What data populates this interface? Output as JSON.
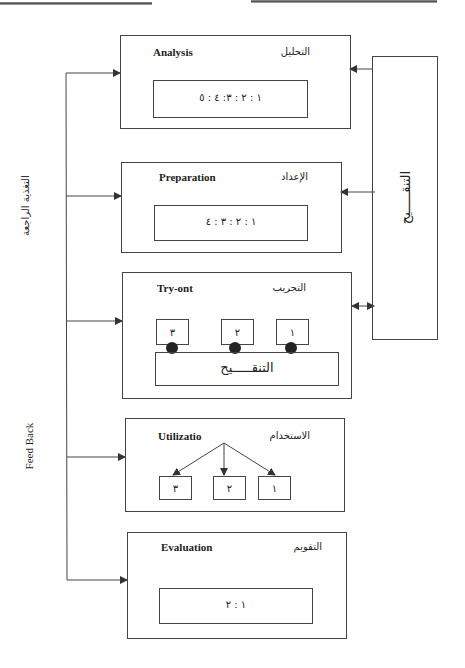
{
  "diagram": {
    "type": "process-flow",
    "stages": [
      {
        "id": "analysis",
        "label_en": "Analysis",
        "label_ar": "التحليل",
        "content": "١ : ٢ : ٣: ٤ : ٥"
      },
      {
        "id": "preparation",
        "label_en": "Preparation",
        "label_ar": "الإعداد",
        "content": "١ : ٢ : ٣ : ٤"
      },
      {
        "id": "try-out",
        "label_en": "Try-ont",
        "label_ar": "التجريب",
        "items": [
          "١",
          "٢",
          "٣"
        ],
        "base_label": "التنقـــــيح"
      },
      {
        "id": "utilization",
        "label_en": "Utilizatio",
        "label_ar": "الاستخدام",
        "items": [
          "١",
          "٢",
          "٣"
        ]
      },
      {
        "id": "evaluation",
        "label_en": "Evaluation",
        "label_ar": "التقويم",
        "content": "١ : ٢"
      }
    ],
    "revision_box": {
      "label": "التنقـــــيح"
    },
    "feedback": {
      "label_en": "Feed Back",
      "label_ar": "التغذية الراجعة"
    }
  },
  "colors": {
    "line": "#444444",
    "text": "#222222",
    "background": "#ffffff"
  }
}
